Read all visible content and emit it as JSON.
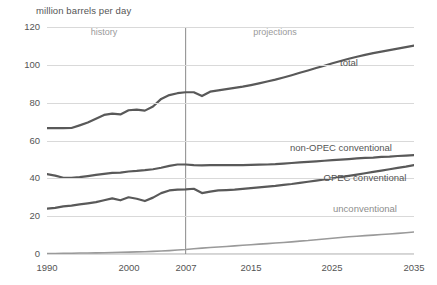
{
  "chart_data": {
    "type": "line",
    "title": "million barrels per day",
    "xlabel": "",
    "ylabel": "million barrels per day",
    "xlim": [
      1990,
      2035
    ],
    "ylim": [
      0,
      120
    ],
    "grid": true,
    "legend_position": "inline-labels",
    "xticks": [
      1990,
      2000,
      2007,
      2015,
      2025,
      2035
    ],
    "xtick_labels": [
      "1990",
      "2000",
      "2007",
      "2015",
      "2025",
      "2035"
    ],
    "yticks": [
      0,
      20,
      40,
      60,
      80,
      100,
      120
    ],
    "ytick_labels": [
      "0",
      "20",
      "40",
      "60",
      "80",
      "100",
      "120"
    ],
    "minor_xticks_interval": 1,
    "annotations": [
      {
        "text": "history",
        "x": 1997,
        "y": 117,
        "color": "#9a9a9a"
      },
      {
        "text": "projections",
        "x": 2018,
        "y": 117,
        "color": "#9a9a9a"
      },
      {
        "text": "total",
        "x": 2027,
        "y": 101,
        "color": "#555555"
      },
      {
        "text": "non-OPEC conventional",
        "x": 2026,
        "y": 56,
        "color": "#555555"
      },
      {
        "text": "OPEC conventional",
        "x": 2029,
        "y": 40,
        "color": "#555555"
      },
      {
        "text": "unconventional",
        "x": 2029,
        "y": 24,
        "color": "#8d8d8d"
      }
    ],
    "divider_year": 2007,
    "x": [
      1990,
      1991,
      1992,
      1993,
      1994,
      1995,
      1996,
      1997,
      1998,
      1999,
      2000,
      2001,
      2002,
      2003,
      2004,
      2005,
      2006,
      2007,
      2008,
      2009,
      2010,
      2011,
      2012,
      2013,
      2014,
      2015,
      2016,
      2017,
      2018,
      2019,
      2020,
      2021,
      2022,
      2023,
      2024,
      2025,
      2026,
      2027,
      2028,
      2029,
      2030,
      2031,
      2032,
      2033,
      2034,
      2035
    ],
    "series": [
      {
        "name": "total",
        "color": "#595959",
        "width": 2.2,
        "values": [
          66.5,
          66.6,
          66.5,
          66.6,
          68.0,
          69.5,
          71.5,
          73.5,
          74.2,
          73.8,
          76.0,
          76.3,
          75.8,
          78.0,
          82.0,
          84.0,
          85.0,
          85.5,
          85.5,
          83.5,
          85.8,
          86.5,
          87.2,
          87.8,
          88.5,
          89.3,
          90.2,
          91.2,
          92.2,
          93.3,
          94.5,
          95.8,
          97.0,
          98.3,
          99.5,
          100.8,
          102.0,
          103.2,
          104.3,
          105.3,
          106.2,
          107.0,
          107.8,
          108.6,
          109.4,
          110.2
        ]
      },
      {
        "name": "non-OPEC conventional",
        "color": "#595959",
        "width": 2.2,
        "values": [
          42.2,
          41.4,
          40.3,
          40.2,
          40.6,
          41.2,
          41.8,
          42.4,
          42.9,
          43.0,
          43.6,
          43.9,
          44.3,
          44.8,
          45.6,
          46.6,
          47.3,
          47.3,
          47.0,
          46.9,
          47.0,
          47.0,
          47.0,
          47.0,
          47.0,
          47.1,
          47.2,
          47.3,
          47.5,
          47.8,
          48.1,
          48.4,
          48.7,
          49.0,
          49.3,
          49.6,
          49.9,
          50.2,
          50.5,
          50.8,
          51.0,
          51.3,
          51.5,
          51.8,
          52.0,
          52.3
        ]
      },
      {
        "name": "OPEC conventional",
        "color": "#595959",
        "width": 2.2,
        "values": [
          24.0,
          24.4,
          25.2,
          25.6,
          26.2,
          26.8,
          27.4,
          28.4,
          29.4,
          28.4,
          30.0,
          29.2,
          28.0,
          29.8,
          32.2,
          33.6,
          34.0,
          34.2,
          34.5,
          32.2,
          33.0,
          33.6,
          33.8,
          34.0,
          34.4,
          34.8,
          35.2,
          35.6,
          36.0,
          36.5,
          37.0,
          37.6,
          38.2,
          38.8,
          39.4,
          40.0,
          40.6,
          41.3,
          42.0,
          42.7,
          43.4,
          44.1,
          44.8,
          45.5,
          46.2,
          47.0
        ]
      },
      {
        "name": "unconventional",
        "color": "#9a9a9a",
        "width": 1.6,
        "values": [
          0.3,
          0.3,
          0.4,
          0.4,
          0.5,
          0.5,
          0.6,
          0.7,
          0.8,
          0.9,
          1.0,
          1.1,
          1.2,
          1.4,
          1.6,
          1.8,
          2.1,
          2.4,
          2.8,
          3.1,
          3.4,
          3.7,
          4.0,
          4.3,
          4.6,
          4.9,
          5.2,
          5.5,
          5.8,
          6.1,
          6.4,
          6.8,
          7.1,
          7.5,
          7.9,
          8.3,
          8.7,
          9.1,
          9.4,
          9.7,
          10.0,
          10.3,
          10.6,
          10.9,
          11.2,
          11.6
        ]
      }
    ]
  }
}
